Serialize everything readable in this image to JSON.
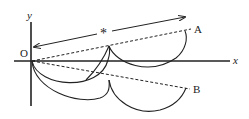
{
  "figure": {
    "labels": {
      "y_axis": "y",
      "x_axis": "x",
      "origin": "O",
      "point_a": "A",
      "point_b": "B",
      "marker": "*"
    }
  }
}
